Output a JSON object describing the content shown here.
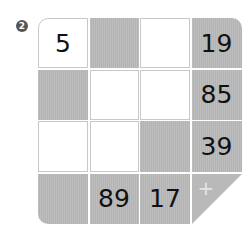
{
  "puzzle": {
    "number_badge": "2",
    "colors": {
      "grey": "#b9b9b9",
      "white": "#ffffff",
      "border": "#c8c8c8",
      "badge": "#555555"
    },
    "grid": [
      [
        {
          "type": "white",
          "value": "5"
        },
        {
          "type": "grey",
          "value": ""
        },
        {
          "type": "white",
          "value": ""
        },
        {
          "type": "grey",
          "value": "19"
        }
      ],
      [
        {
          "type": "grey",
          "value": ""
        },
        {
          "type": "white",
          "value": ""
        },
        {
          "type": "white",
          "value": ""
        },
        {
          "type": "grey",
          "value": "85"
        }
      ],
      [
        {
          "type": "white",
          "value": ""
        },
        {
          "type": "white",
          "value": ""
        },
        {
          "type": "grey",
          "value": ""
        },
        {
          "type": "grey",
          "value": "39"
        }
      ],
      [
        {
          "type": "grey",
          "value": ""
        },
        {
          "type": "grey",
          "value": "89"
        },
        {
          "type": "grey",
          "value": "17"
        },
        {
          "type": "triangle",
          "value": "+"
        }
      ]
    ]
  }
}
